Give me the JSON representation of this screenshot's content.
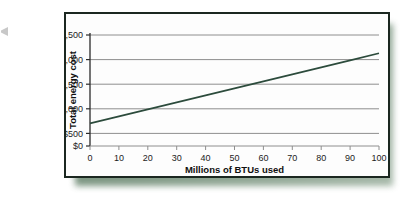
{
  "figure": {
    "frame_border_color": "#1b2720",
    "shadow_color": "#6d8a73",
    "background": "#fdfdfd"
  },
  "chart_data": {
    "type": "line",
    "title": "",
    "xlabel": "Millions of BTUs used",
    "ylabel": "Total energy cost",
    "xlim": [
      0,
      100
    ],
    "ylim": [
      0,
      2500
    ],
    "xticks": [
      0,
      10,
      20,
      30,
      40,
      50,
      60,
      70,
      80,
      90,
      100
    ],
    "xtick_labels": [
      "0",
      "10",
      "20",
      "30",
      "40",
      "50",
      "60",
      "70",
      "80",
      "90",
      "100"
    ],
    "yticks": [
      0,
      500,
      1000,
      1500,
      2000,
      2500
    ],
    "ytick_labels": [
      "$0",
      "$500",
      "$1,000",
      "$1,500",
      "$2,000",
      "$2,500"
    ],
    "grid": true,
    "grid_axis": "y",
    "grid_color": "#8e8e8e",
    "legend": false,
    "series": [
      {
        "name": "Total energy cost",
        "color": "#2c4b3c",
        "line_width": 1.6,
        "x": [
          0,
          10,
          20,
          30,
          40,
          50,
          60,
          70,
          80,
          90,
          100
        ],
        "values": [
          500,
          655,
          810,
          965,
          1120,
          1275,
          1430,
          1585,
          1740,
          1895,
          2050
        ]
      }
    ],
    "annotations": {
      "intercept": 500,
      "slope_per_million_btu": 15.5,
      "endpoint_value": 2050
    }
  }
}
